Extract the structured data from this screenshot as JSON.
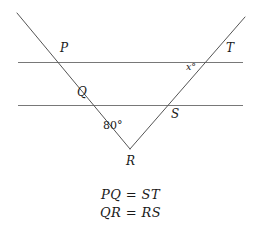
{
  "figure": {
    "type": "geometry-diagram",
    "background_color": "#ffffff",
    "line_color": "#787878",
    "text_color": "#1a1a1a",
    "width": 261,
    "height": 240
  },
  "labels": {
    "p": "P",
    "q": "Q",
    "r": "R",
    "s": "S",
    "t": "T"
  },
  "angles": {
    "vertex_r": "80°",
    "at_t": "x°"
  },
  "given": {
    "line1": "PQ = ST",
    "line2": "QR = RS"
  },
  "geometry": {
    "vertex_r": {
      "x": 130,
      "y": 149
    },
    "left_ray_start": {
      "x": 17,
      "y": 13
    },
    "right_ray_end": {
      "x": 245,
      "y": 17
    },
    "top_transversal": {
      "x1": 18,
      "y": 62,
      "x2": 243
    },
    "bottom_transversal": {
      "x1": 18,
      "y": 105,
      "x2": 243
    },
    "point_p": {
      "x": 55,
      "y": 62
    },
    "point_q": {
      "x": 92,
      "y": 105
    },
    "point_s": {
      "x": 167,
      "y": 105
    },
    "point_t": {
      "x": 222,
      "y": 62
    }
  }
}
